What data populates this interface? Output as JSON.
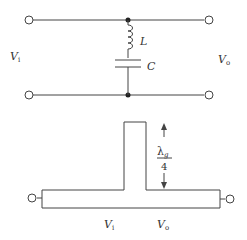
{
  "circuit": {
    "input_label": "V",
    "input_sub": "i",
    "output_label": "V",
    "output_sub": "o",
    "inductor_label": "L",
    "capacitor_label": "C"
  },
  "stub": {
    "length_numerator": "λ",
    "length_numerator_sub": "g",
    "length_denominator": "4",
    "input_label": "V",
    "input_sub": "i",
    "output_label": "V",
    "output_sub": "o"
  },
  "colors": {
    "line": "#444444",
    "node": "#222222"
  }
}
